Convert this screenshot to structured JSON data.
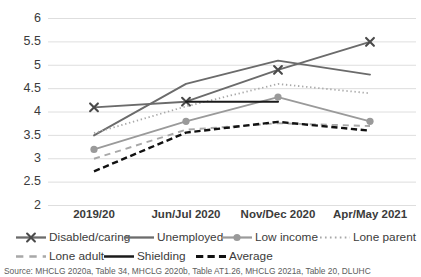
{
  "chart_data": {
    "type": "line",
    "title": "",
    "xlabel": "",
    "ylabel": "",
    "categories": [
      "2019/20",
      "Jun/Jul 2020",
      "Nov/Dec 2020",
      "Apr/May 2021"
    ],
    "ylim": [
      2,
      6
    ],
    "ytick_step": 0.5,
    "yticks": [
      "6",
      "5.5",
      "5",
      "4.5",
      "4",
      "3.5",
      "3",
      "2.5",
      "2"
    ],
    "grid": true,
    "legend_position": "bottom",
    "series": [
      {
        "name": "Disabled/caring",
        "values": [
          4.1,
          4.22,
          4.9,
          5.5
        ],
        "color": "#6b6b6b",
        "style": "solid",
        "marker": "x",
        "width": 1.9
      },
      {
        "name": "Unemployed",
        "values": [
          3.5,
          4.6,
          5.1,
          4.8
        ],
        "color": "#6b6b6b",
        "style": "solid",
        "marker": "none",
        "width": 1.9
      },
      {
        "name": "Low income",
        "values": [
          3.2,
          3.8,
          4.32,
          3.8
        ],
        "color": "#9a9a9a",
        "style": "solid",
        "marker": "circle",
        "width": 1.8
      },
      {
        "name": "Lone parent",
        "values": [
          3.55,
          4.12,
          4.6,
          4.4
        ],
        "color": "#a8a8a8",
        "style": "dotted",
        "marker": "none",
        "width": 1.8
      },
      {
        "name": "Lone adult",
        "values": [
          3.0,
          3.62,
          3.76,
          3.7
        ],
        "color": "#a8a8a8",
        "style": "dashed",
        "marker": "none",
        "width": 1.9
      },
      {
        "name": "Shielding",
        "values": [
          null,
          4.22,
          4.22,
          null
        ],
        "color": "#1b1b1b",
        "style": "solid",
        "marker": "none",
        "width": 2.1
      },
      {
        "name": "Average",
        "values": [
          2.73,
          3.56,
          3.79,
          3.6
        ],
        "color": "#111111",
        "style": "dashed-heavy",
        "marker": "none",
        "width": 2.4
      }
    ]
  },
  "legend": {
    "rows": [
      [
        "Disabled/caring",
        "Unemployed",
        "Low income",
        "Lone parent"
      ],
      [
        "Lone adult",
        "Shielding",
        "Average"
      ]
    ]
  },
  "source": {
    "text": "Source: MHCLG 2020a, Table 34, MHCLG 2020b, Table AT1.26, MHCLG 2021a, Table 20, DLUHC"
  }
}
